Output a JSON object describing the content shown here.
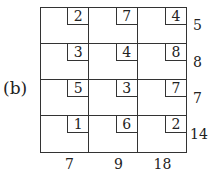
{
  "figure": {
    "label": "(b)",
    "costs": [
      [
        "2",
        "7",
        "4"
      ],
      [
        "3",
        "4",
        "8"
      ],
      [
        "5",
        "3",
        "7"
      ],
      [
        "1",
        "6",
        "2"
      ]
    ],
    "supply": [
      "5",
      "8",
      "7",
      "14"
    ],
    "demand": [
      "7",
      "9",
      "18"
    ]
  }
}
